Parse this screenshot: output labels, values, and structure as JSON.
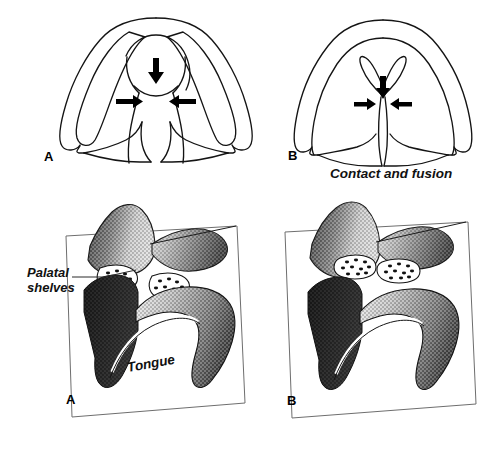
{
  "figure": {
    "background_color": "#ffffff",
    "ink_color": "#000000",
    "width": 493,
    "height": 454
  },
  "panels": {
    "top_left": {
      "letter": "A",
      "view": "coronal-section-before-elevation",
      "arrows": [
        {
          "name": "nasal-septum-down-arrow",
          "direction": "down"
        },
        {
          "name": "shelf-arrow-left",
          "direction": "left"
        },
        {
          "name": "shelf-arrow-right",
          "direction": "right"
        }
      ]
    },
    "top_right": {
      "letter": "B",
      "view": "coronal-section-after-fusion",
      "caption": "Contact and fusion",
      "arrows": [
        {
          "name": "nasal-septum-down-arrow",
          "direction": "down"
        },
        {
          "name": "shelf-arrow-left",
          "direction": "left"
        },
        {
          "name": "shelf-arrow-right",
          "direction": "right"
        }
      ]
    },
    "bottom_left": {
      "letter": "A",
      "view": "three-dimensional-cutaway-shelves-vertical",
      "labels": {
        "palatal_shelves_line1": "Palatal",
        "palatal_shelves_line2": "shelves",
        "tongue": "Tongue"
      }
    },
    "bottom_right": {
      "letter": "B",
      "view": "three-dimensional-cutaway-shelves-fused"
    }
  },
  "legend_colors": {
    "tissue_dark": "#3a3a3a",
    "tissue_mid": "#8c8c8c",
    "tissue_light": "#d8d8d8",
    "outline": "#1a1a1a",
    "shelf_fill": "#ffffff",
    "shelf_speckle": "#141414"
  }
}
